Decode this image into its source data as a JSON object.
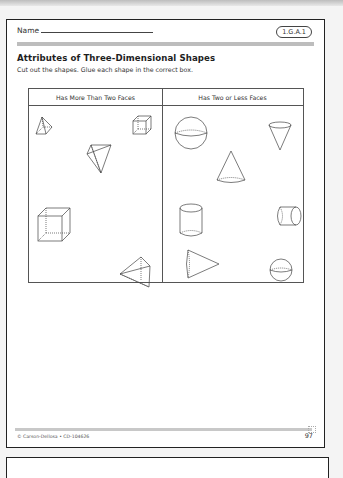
{
  "worksheet": {
    "name_label": "Name",
    "standard_code": "1.G.A.1",
    "title": "Attributes of Three-Dimensional Shapes",
    "instructions": "Cut out the shapes. Glue each shape in the correct box.",
    "table": {
      "columns": [
        "Has More Than Two Faces",
        "Has Two or Less Faces"
      ],
      "left_shapes": [
        "square-pyramid-icon",
        "cube-icon",
        "inverted-pyramid-icon",
        "cube-icon",
        "triangular-pyramid-icon"
      ],
      "right_shapes": [
        "sphere-icon",
        "inverted-cone-icon",
        "cone-icon",
        "cylinder-icon",
        "horizontal-cylinder-icon",
        "sideways-cone-icon",
        "sphere-icon"
      ]
    },
    "footer": {
      "copyright": "© Carson-Dellosa • CD-104626",
      "page_number": "97"
    }
  }
}
